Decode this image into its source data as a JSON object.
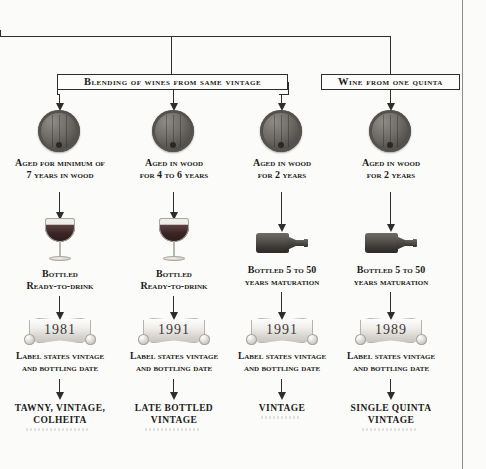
{
  "diagram": {
    "colors": {
      "ink": "#1d1b1a",
      "line": "#2f2d2b",
      "page": "#fbfbf9",
      "barrel": "#6f6c67",
      "bottle": "#585550",
      "scroll": "#f1efec"
    },
    "category_boxes": [
      {
        "label": "Blending of wines from same vintage"
      },
      {
        "label": "Wine from one quinta"
      }
    ],
    "columns": [
      {
        "aging": "Aged for minimum of\n7 years in wood",
        "vessel": "wine-glass",
        "bottling": "Bottled\nReady-to-drink",
        "year": "1981",
        "label_note": "Label states vintage\nand bottling date",
        "product": "TAWNY, VINTAGE,\nCOLHEITA"
      },
      {
        "aging": "Aged in wood\nfor 4 to 6 years",
        "vessel": "wine-glass",
        "bottling": "Bottled\nReady-to-drink",
        "year": "1991",
        "label_note": "Label states vintage\nand bottling date",
        "product": "LATE BOTTLED\nVINTAGE"
      },
      {
        "aging": "Aged in wood\nfor 2 years",
        "vessel": "wine-bottle",
        "bottling": "Bottled 5 to 50\nyears maturation",
        "year": "1991",
        "label_note": "Label states vintage\nand bottling date",
        "product": "VINTAGE"
      },
      {
        "aging": "Aged in wood\nfor 2 years",
        "vessel": "wine-bottle",
        "bottling": "Bottled 5 to 50\nyears maturation",
        "year": "1989",
        "label_note": "Label states vintage\nand bottling date",
        "product": "SINGLE QUINTA\nVINTAGE"
      }
    ]
  }
}
